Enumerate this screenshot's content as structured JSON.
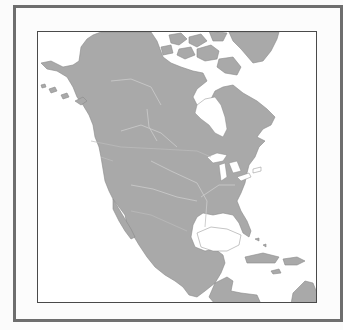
{
  "map": {
    "title": "",
    "region": "North America",
    "style": "blank outline map",
    "colors": {
      "land": "#a9a9a9",
      "water": "#ffffff",
      "rivers": "#c8c8c8",
      "outer_frame": "#6e6e6e",
      "inner_frame": "#4a4a4a",
      "page": "#fbfbfb"
    },
    "features": [
      "Alaska",
      "Canada",
      "Greenland",
      "Hudson Bay",
      "Great Lakes",
      "United States",
      "Mexico",
      "Gulf of Mexico",
      "Caribbean islands",
      "Central America"
    ],
    "labels": []
  }
}
